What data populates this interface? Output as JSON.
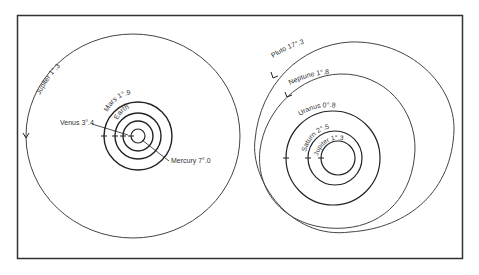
{
  "figure": {
    "frame_color": "#333333",
    "line_color": "#222222",
    "background": "#ffffff"
  },
  "left_diagram": {
    "outer_orbit": {
      "planet": "Jupiter",
      "label": "Jupiter 1°.3"
    },
    "inner_orbits": [
      {
        "planet": "Mercury",
        "label": "Mercury 7°.0"
      },
      {
        "planet": "Venus",
        "label": "Venus 3°.4"
      },
      {
        "planet": "Earth",
        "label": "Earth"
      },
      {
        "planet": "Mars",
        "label": "Mars 1°.9"
      }
    ]
  },
  "right_diagram": {
    "orbits": [
      {
        "planet": "Jupiter",
        "label": "Jupiter 1°.3"
      },
      {
        "planet": "Saturn",
        "label": "Saturn 2°.5"
      },
      {
        "planet": "Uranus",
        "label": "Uranus 0°.8"
      },
      {
        "planet": "Neptune",
        "label": "Neptune 1°.8"
      },
      {
        "planet": "Pluto",
        "label": "Pluto 17°.3"
      }
    ]
  }
}
